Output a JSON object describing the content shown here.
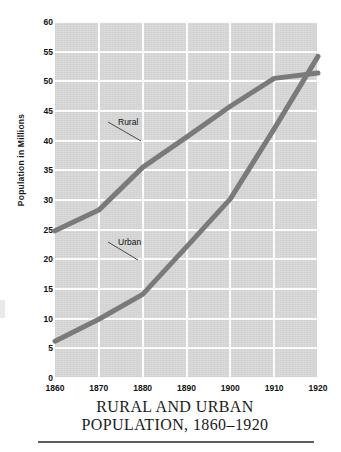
{
  "chart_data": {
    "type": "line",
    "title": "RURAL AND URBAN POPULATION, 1860–1920",
    "title_line1": "RURAL AND URBAN",
    "title_line2": "POPULATION, 1860–1920",
    "xlabel": "",
    "ylabel": "Population  in  Millions",
    "x": [
      1860,
      1870,
      1880,
      1890,
      1900,
      1910,
      1920
    ],
    "xlim": [
      1860,
      1920
    ],
    "ylim": [
      0,
      60
    ],
    "ytick_labels": [
      "0",
      "5",
      "10",
      "15",
      "20",
      "25",
      "30",
      "35",
      "40",
      "45",
      "50",
      "55",
      "60"
    ],
    "ytick_values": [
      0,
      5,
      10,
      15,
      20,
      25,
      30,
      35,
      40,
      45,
      50,
      55,
      60
    ],
    "xtick_labels": [
      "1860",
      "1870",
      "1880",
      "1890",
      "1900",
      "1910",
      "1920"
    ],
    "grid": true,
    "grid_color": "#fdfdfd",
    "plot_background": "#d4d4d4",
    "legend_position": "inline-annotations",
    "series": [
      {
        "name": "Rural",
        "label": "Rural",
        "color": "#7a7a7a",
        "values": [
          24.8,
          28.3,
          35.5,
          40.6,
          45.8,
          50.5,
          51.4
        ]
      },
      {
        "name": "Urban",
        "label": "Urban",
        "color": "#7a7a7a",
        "values": [
          6.2,
          9.9,
          14.1,
          22.1,
          30.2,
          42.0,
          54.2
        ]
      }
    ],
    "annotations": [
      {
        "text": "Rural",
        "series": "Rural",
        "leader_line": true
      },
      {
        "text": "Urban",
        "series": "Urban",
        "leader_line": true
      }
    ]
  },
  "colors": {
    "line": "#7a7a7a",
    "plot_bg": "#d4d4d4",
    "grid": "#fdfdfd",
    "text": "#111111",
    "rule": "#5c5c5c"
  }
}
